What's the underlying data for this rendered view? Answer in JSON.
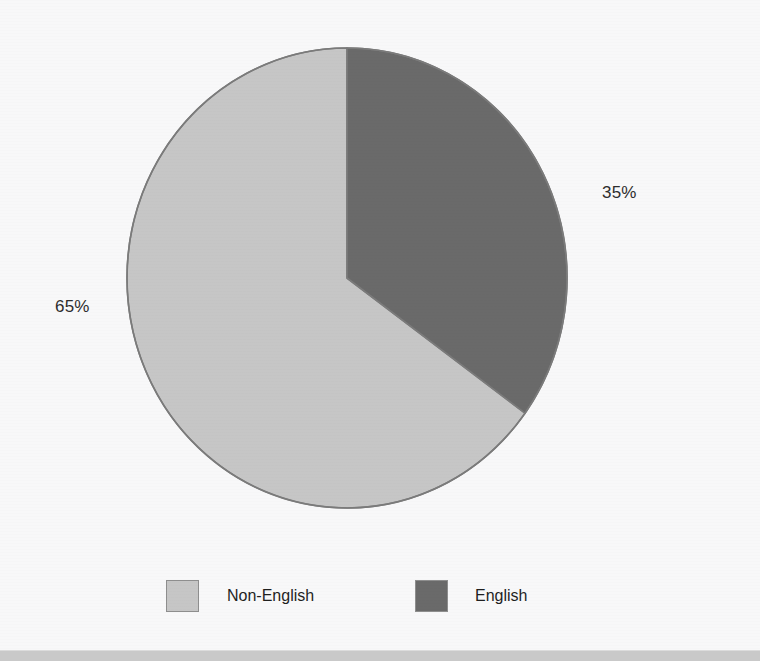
{
  "chart_data": {
    "type": "pie",
    "title": "",
    "subtitle": "",
    "xlabel": "",
    "ylabel": "",
    "legend_position": "bottom",
    "grid": false,
    "categories": [
      "Non-English",
      "English"
    ],
    "values": [
      65,
      35
    ],
    "unit": "%",
    "slices": [
      {
        "label": "Non-English",
        "value": 65,
        "data_label": "65%",
        "color": "#c6c6c6",
        "start_angle_deg": 126,
        "end_angle_deg": 360
      },
      {
        "label": "English",
        "value": 35,
        "data_label": "35%",
        "color": "#6a6a6a",
        "start_angle_deg": 0,
        "end_angle_deg": 126
      }
    ],
    "annotations": [
      "65%",
      "35%"
    ]
  },
  "labels": {
    "english_pct": "35%",
    "nonenglish_pct": "65%"
  },
  "legend": {
    "items": [
      {
        "label": "Non-English",
        "color": "#c6c6c6"
      },
      {
        "label": "English",
        "color": "#6a6a6a"
      }
    ]
  },
  "colors": {
    "background": "#f8f8f9",
    "slice_light": "#c6c6c6",
    "slice_dark": "#6a6a6a",
    "outline": "#7b7b7b",
    "text": "#2d2d2d",
    "footer_strip": "#c9c9c9"
  }
}
